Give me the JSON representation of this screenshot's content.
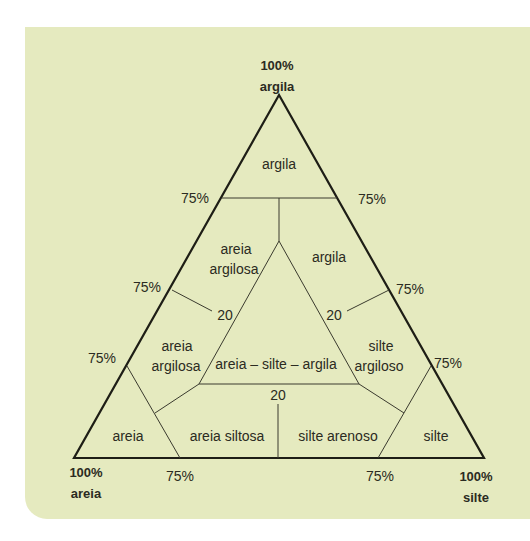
{
  "diagram": {
    "type": "soil texture ternary diagram",
    "colors": {
      "panel_bg": "#e5eabf",
      "line": "#1e1e16",
      "text": "#2b2b22"
    },
    "vertices": {
      "top": {
        "percent": "100%",
        "label": "argila"
      },
      "bottom_left": {
        "percent": "100%",
        "label": "areia"
      },
      "bottom_right": {
        "percent": "100%",
        "label": "silte"
      }
    },
    "tick_labels": {
      "left_upper": "75%",
      "left_middle": "75%",
      "left_lower": "75%",
      "right_upper": "75%",
      "right_middle": "75%",
      "right_lower": "75%",
      "bottom_left": "75%",
      "bottom_right": "75%",
      "inner_left": "20",
      "inner_right": "20",
      "inner_bottom": "20"
    },
    "regions": {
      "top_argila": "argila",
      "areia_argilosa_upper": {
        "line1": "areia",
        "line2": "argilosa"
      },
      "argila_right": "argila",
      "areia_argilosa_lower": {
        "line1": "areia",
        "line2": "argilosa"
      },
      "center": "areia – silte – argila",
      "silte_argiloso": {
        "line1": "silte",
        "line2": "argiloso"
      },
      "areia": "areia",
      "areia_siltosa": "areia siltosa",
      "silte_arenoso": "silte arenoso",
      "silte": "silte"
    }
  }
}
